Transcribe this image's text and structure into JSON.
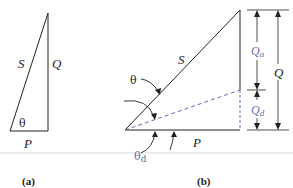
{
  "colors": {
    "line": "#222222",
    "accent_blue": "#5a6fb0",
    "background": "#ffffff"
  },
  "figure_a": {
    "caption": "(a)",
    "labels": {
      "hypotenuse": "S",
      "vertical_side": "Q",
      "angle": "θ",
      "base": "P"
    }
  },
  "figure_b": {
    "caption": "(b)",
    "labels": {
      "hypotenuse": "S",
      "angle": "θ",
      "base": "P",
      "total_height": "Q",
      "upper_part_main": "Q",
      "upper_part_sub": "a",
      "lower_part_main": "Q",
      "lower_part_sub": "d",
      "displacement_angle_main": "θ",
      "displacement_angle_sub": "d"
    }
  }
}
